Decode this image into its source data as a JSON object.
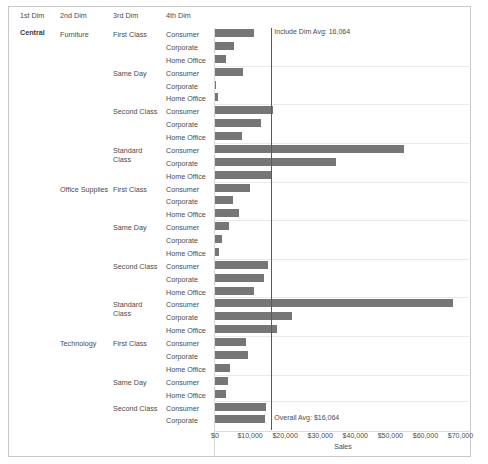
{
  "header": {
    "columns": [
      "1st Dim",
      "2nd Dim",
      "3rd Dim",
      "4th Dim"
    ]
  },
  "dim1_value": "Central",
  "reference_lines": [
    {
      "name": "include-dim-avg",
      "label": "Include Dim Avg: 16,064",
      "value": 16064,
      "position": "top"
    },
    {
      "name": "overall-avg",
      "label": "Overall Avg: $16,064",
      "value": 16064,
      "position": "bottom"
    }
  ],
  "chart_data": {
    "type": "bar",
    "orientation": "horizontal",
    "title": "",
    "xlabel": "Sales",
    "ylabel": "",
    "xlim": [
      0,
      73000
    ],
    "grid": true,
    "legend": null,
    "axis_ticks": [
      "$0",
      "$10,000",
      "$20,000",
      "$30,000",
      "$40,000",
      "$50,000",
      "$60,000",
      "$70,000"
    ],
    "axis_tick_values": [
      0,
      10000,
      20000,
      30000,
      40000,
      50000,
      60000,
      70000
    ],
    "dim1": "Central",
    "rows": [
      {
        "dim2": "Furniture",
        "dim3": "First Class",
        "dim4": "Consumer",
        "value": 11200
      },
      {
        "dim2": "",
        "dim3": "",
        "dim4": "Corporate",
        "value": 5500
      },
      {
        "dim2": "",
        "dim3": "",
        "dim4": "Home Office",
        "value": 3100
      },
      {
        "dim2": "",
        "dim3": "Same Day",
        "dim4": "Consumer",
        "value": 8100
      },
      {
        "dim2": "",
        "dim3": "",
        "dim4": "Corporate",
        "value": 250
      },
      {
        "dim2": "",
        "dim3": "",
        "dim4": "Home Office",
        "value": 900
      },
      {
        "dim2": "",
        "dim3": "Second Class",
        "dim4": "Consumer",
        "value": 16400
      },
      {
        "dim2": "",
        "dim3": "",
        "dim4": "Corporate",
        "value": 13200
      },
      {
        "dim2": "",
        "dim3": "",
        "dim4": "Home Office",
        "value": 7600
      },
      {
        "dim2": "",
        "dim3": "Standard Class",
        "dim4": "Consumer",
        "value": 54000
      },
      {
        "dim2": "",
        "dim3": "",
        "dim4": "Corporate",
        "value": 34500
      },
      {
        "dim2": "",
        "dim3": "",
        "dim4": "Home Office",
        "value": 16200
      },
      {
        "dim2": "Office Supplies",
        "dim3": "First Class",
        "dim4": "Consumer",
        "value": 9900
      },
      {
        "dim2": "",
        "dim3": "",
        "dim4": "Corporate",
        "value": 5200
      },
      {
        "dim2": "",
        "dim3": "",
        "dim4": "Home Office",
        "value": 6900
      },
      {
        "dim2": "",
        "dim3": "Same Day",
        "dim4": "Consumer",
        "value": 4100
      },
      {
        "dim2": "",
        "dim3": "",
        "dim4": "Corporate",
        "value": 1900
      },
      {
        "dim2": "",
        "dim3": "",
        "dim4": "Home Office",
        "value": 1100
      },
      {
        "dim2": "",
        "dim3": "Second Class",
        "dim4": "Consumer",
        "value": 15200
      },
      {
        "dim2": "",
        "dim3": "",
        "dim4": "Corporate",
        "value": 14000
      },
      {
        "dim2": "",
        "dim3": "",
        "dim4": "Home Office",
        "value": 11000
      },
      {
        "dim2": "",
        "dim3": "Standard Class",
        "dim4": "Consumer",
        "value": 68000
      },
      {
        "dim2": "",
        "dim3": "",
        "dim4": "Corporate",
        "value": 22000
      },
      {
        "dim2": "",
        "dim3": "",
        "dim4": "Home Office",
        "value": 17600
      },
      {
        "dim2": "Technology",
        "dim3": "First Class",
        "dim4": "Consumer",
        "value": 8900
      },
      {
        "dim2": "",
        "dim3": "",
        "dim4": "Corporate",
        "value": 9400
      },
      {
        "dim2": "",
        "dim3": "",
        "dim4": "Home Office",
        "value": 4300
      },
      {
        "dim2": "",
        "dim3": "Same Day",
        "dim4": "Consumer",
        "value": 3700
      },
      {
        "dim2": "",
        "dim3": "",
        "dim4": "Home Office",
        "value": 3200
      },
      {
        "dim2": "",
        "dim3": "Second Class",
        "dim4": "Consumer",
        "value": 14500
      },
      {
        "dim2": "",
        "dim3": "",
        "dim4": "Corporate",
        "value": 14300
      }
    ]
  }
}
